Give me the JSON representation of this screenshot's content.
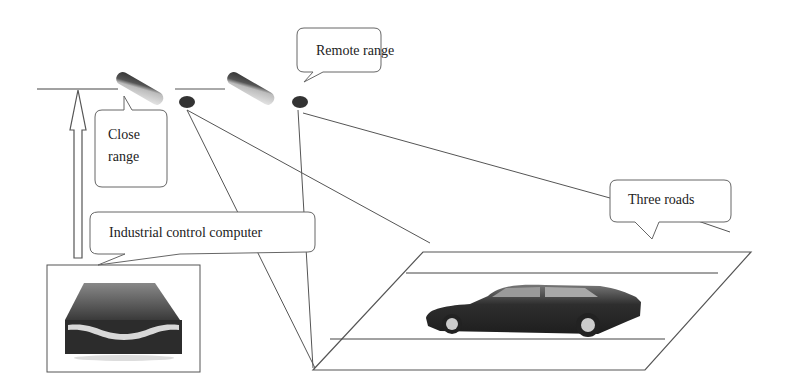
{
  "diagram": {
    "callouts": {
      "remote_range": "Remote range",
      "close_range_line1": "Close",
      "close_range_line2": "range",
      "three_roads": "Three roads",
      "industrial_computer": "Industrial control computer"
    },
    "components": [
      {
        "name": "close-range-camera",
        "icon": "camera-icon"
      },
      {
        "name": "remote-range-camera",
        "icon": "camera-icon"
      },
      {
        "name": "industrial-control-computer",
        "icon": "server-icon"
      },
      {
        "name": "road-plane",
        "icon": "road-icon"
      },
      {
        "name": "car",
        "icon": "car-icon"
      },
      {
        "name": "height-arrow",
        "icon": "arrow-up-icon"
      }
    ],
    "colors": {
      "line": "#444444",
      "camera_dark": "#3a3a3a",
      "camera_light": "#cfcfcf",
      "background": "#ffffff"
    }
  }
}
